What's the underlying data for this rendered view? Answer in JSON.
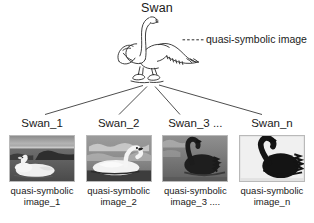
{
  "diagram": {
    "root": {
      "label": "Swan"
    },
    "annotation": {
      "label": "quasi-symbolic image"
    },
    "instances": [
      {
        "title": "Swan_1",
        "caption_line1": "quasi-symbolic",
        "caption_line2": "image_1",
        "thumb_name": "swan-photo-white-on-lake"
      },
      {
        "title": "Swan_2",
        "caption_line1": "quasi-symbolic",
        "caption_line2": "image_2",
        "thumb_name": "swan-photo-white-swimming"
      },
      {
        "title": "Swan_3 ...",
        "caption_line1": "quasi-symbolic",
        "caption_line2": "image_3 ....",
        "thumb_name": "swan-photo-black-swimming"
      },
      {
        "title": "Swan_n",
        "caption_line1": "quasi-symbolic",
        "caption_line2": "image_n",
        "thumb_name": "swan-photo-black-profile"
      }
    ],
    "colors": {
      "ink": "#1a1a1a",
      "line": "#3a3a3a",
      "background": "#ffffff",
      "thumb_border": "#b9b9b9"
    }
  }
}
